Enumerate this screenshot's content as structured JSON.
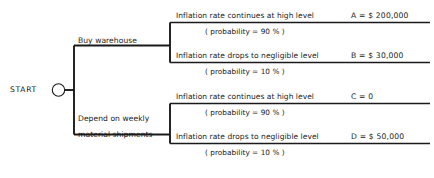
{
  "diagram": {
    "type": "decision-tree",
    "title": "",
    "start": {
      "label": "START"
    },
    "decisions": [
      {
        "id": "buy-warehouse",
        "label": "Buy warehouse",
        "label_line1": "Buy warehouse",
        "label_line2": ""
      },
      {
        "id": "depend-weekly-shipments",
        "label": "Depend on weekly material shipments",
        "label_line1": "Depend on weekly",
        "label_line2": "material shipments"
      }
    ],
    "outcomes": [
      {
        "id": "A",
        "branch": "buy-warehouse",
        "event": "Inflation rate continues at high level",
        "probability": "( probability = 90 % )",
        "payoff": "A = $ 200,000"
      },
      {
        "id": "B",
        "branch": "buy-warehouse",
        "event": "Inflation rate drops to negligible level",
        "probability": "( probability = 10 % )",
        "payoff": "B = $ 30,000"
      },
      {
        "id": "C",
        "branch": "depend-weekly-shipments",
        "event": "Inflation rate continues at high level",
        "probability": "( probability = 90 % )",
        "payoff": "C = 0"
      },
      {
        "id": "D",
        "branch": "depend-weekly-shipments",
        "event": "Inflation rate drops to negligible level",
        "probability": "( probability = 10 % )",
        "payoff": "D = $ 50,000"
      }
    ],
    "colors": {
      "line": "#1a1a1a",
      "text": "#1a1a1a",
      "background": "#ffffff"
    }
  }
}
